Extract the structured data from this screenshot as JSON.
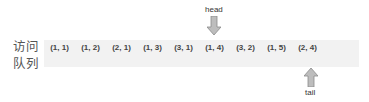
{
  "queue_label": "访问\n队列",
  "queue_label_lines": [
    "访问",
    "队列"
  ],
  "cells": [
    "(1, 1)",
    "(1, 2)",
    "(2, 1)",
    "(1, 3)",
    "(3, 1)",
    "(1, 4)",
    "(3, 2)",
    "(1, 5)",
    "(2, 4)",
    ""
  ],
  "head_label": "head",
  "tail_label": "tail",
  "head_index": 5,
  "tail_index": 8,
  "colors": {
    "bar": "#f2f2f2",
    "arrow_fill": "#bdbdbd",
    "arrow_stroke": "#8a8a8a",
    "text": "#444444"
  }
}
